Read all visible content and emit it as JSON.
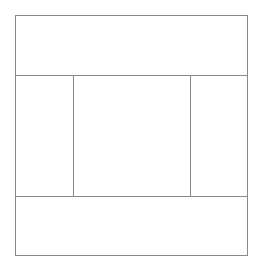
{
  "diagram": {
    "type": "layout-wireframe",
    "line_color": "#8a8a8a",
    "background": "#ffffff",
    "outer_box": {
      "left": 15,
      "top": 15,
      "right": 247,
      "bottom": 255
    },
    "regions": [
      {
        "name": "header",
        "left": 15,
        "top": 15,
        "right": 247,
        "bottom": 75
      },
      {
        "name": "left-sidebar",
        "left": 15,
        "top": 75,
        "right": 73,
        "bottom": 196
      },
      {
        "name": "main-content",
        "left": 73,
        "top": 75,
        "right": 190,
        "bottom": 196
      },
      {
        "name": "right-sidebar",
        "left": 190,
        "top": 75,
        "right": 247,
        "bottom": 196
      },
      {
        "name": "footer",
        "left": 15,
        "top": 196,
        "right": 247,
        "bottom": 255
      }
    ]
  }
}
